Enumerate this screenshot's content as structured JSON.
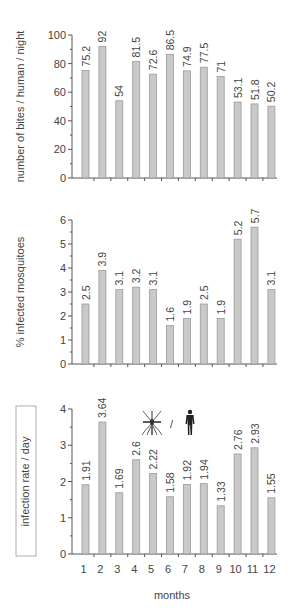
{
  "chart_data": [
    {
      "type": "bar",
      "title": "",
      "xlabel": "",
      "ylabel": "number of bites / human / night",
      "ylim": [
        0,
        100
      ],
      "yticks": [
        0,
        20,
        40,
        60,
        80,
        100
      ],
      "categories": [
        "1",
        "2",
        "3",
        "4",
        "5",
        "6",
        "7",
        "8",
        "9",
        "10",
        "11",
        "12"
      ],
      "values": [
        75.2,
        92,
        54,
        81.5,
        72.6,
        86.5,
        74.9,
        77.5,
        71,
        53.1,
        51.8,
        50.2
      ],
      "value_labels": [
        "75.2",
        "92",
        "54",
        "81.5",
        "72.6",
        "86.5",
        "74.9",
        "77.5",
        "71",
        "53.1",
        "51.8",
        "50.2"
      ]
    },
    {
      "type": "bar",
      "title": "",
      "xlabel": "",
      "ylabel": "% infected mosquitoes",
      "ylim": [
        0,
        6
      ],
      "yticks": [
        0,
        1,
        2,
        3,
        4,
        5,
        6
      ],
      "categories": [
        "1",
        "2",
        "3",
        "4",
        "5",
        "6",
        "7",
        "8",
        "9",
        "10",
        "11",
        "12"
      ],
      "values": [
        2.5,
        3.9,
        3.1,
        3.2,
        3.1,
        1.6,
        1.9,
        2.5,
        1.9,
        5.2,
        5.7,
        3.1
      ],
      "value_labels": [
        "2.5",
        "3.9",
        "3.1",
        "3.2",
        "3.1",
        "1.6",
        "1.9",
        "2.5",
        "1.9",
        "5.2",
        "5.7",
        "3.1"
      ]
    },
    {
      "type": "bar",
      "title": "",
      "xlabel": "months",
      "ylabel": "infection rate / day",
      "ylim": [
        0,
        4
      ],
      "yticks": [
        0,
        1,
        2,
        3,
        4
      ],
      "categories": [
        "1",
        "2",
        "3",
        "4",
        "5",
        "6",
        "7",
        "8",
        "9",
        "10",
        "11",
        "12"
      ],
      "values": [
        1.91,
        3.64,
        1.69,
        2.6,
        2.22,
        1.58,
        1.92,
        1.94,
        1.33,
        2.76,
        2.93,
        1.55
      ],
      "value_labels": [
        "1.91",
        "3.64",
        "1.69",
        "2.6",
        "2.22",
        "1.58",
        "1.92",
        "1.94",
        "1.33",
        "2.76",
        "2.93",
        "1.55"
      ],
      "annotation": {
        "icons": [
          "mosquito-icon",
          "human-icon"
        ],
        "separator": "/"
      }
    }
  ],
  "layout": {
    "panels": [
      {
        "top": 35,
        "bottom": 178
      },
      {
        "top": 220,
        "bottom": 364
      },
      {
        "top": 409,
        "bottom": 554
      }
    ],
    "axis_left": 72,
    "axis_right": 277,
    "first_bar_left": 82,
    "bar_step": 16.9,
    "bar_width": 7
  },
  "colors": {
    "bar_fill": "#c9c9c9",
    "bar_stroke": "#9a9a9a",
    "axis": "#555555"
  }
}
